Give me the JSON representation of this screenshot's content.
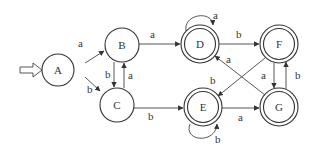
{
  "diagram": {
    "type": "finite-state-automaton",
    "start_state": "A",
    "states": [
      {
        "id": "A",
        "label": "A",
        "accepting": false,
        "x": 70,
        "y": 70
      },
      {
        "id": "B",
        "label": "B",
        "accepting": false,
        "x": 122,
        "y": 45
      },
      {
        "id": "C",
        "label": "C",
        "accepting": false,
        "x": 117,
        "y": 104
      },
      {
        "id": "D",
        "label": "D",
        "accepting": true,
        "x": 200,
        "y": 44
      },
      {
        "id": "E",
        "label": "E",
        "accepting": true,
        "x": 203,
        "y": 107
      },
      {
        "id": "F",
        "label": "F",
        "accepting": true,
        "x": 279,
        "y": 44
      },
      {
        "id": "G",
        "label": "G",
        "accepting": true,
        "x": 279,
        "y": 107
      }
    ],
    "transitions": [
      {
        "from": "A",
        "to": "B",
        "label": "a"
      },
      {
        "from": "A",
        "to": "C",
        "label": "b"
      },
      {
        "from": "B",
        "to": "C",
        "label": "b"
      },
      {
        "from": "C",
        "to": "B",
        "label": "a"
      },
      {
        "from": "B",
        "to": "D",
        "label": "a"
      },
      {
        "from": "C",
        "to": "E",
        "label": "b"
      },
      {
        "from": "D",
        "to": "D",
        "label": "a"
      },
      {
        "from": "D",
        "to": "F",
        "label": "b"
      },
      {
        "from": "E",
        "to": "E",
        "label": "b"
      },
      {
        "from": "E",
        "to": "G",
        "label": "a"
      },
      {
        "from": "F",
        "to": "E",
        "label": "b"
      },
      {
        "from": "F",
        "to": "G",
        "label": "a"
      },
      {
        "from": "G",
        "to": "F",
        "label": "b"
      },
      {
        "from": "G",
        "to": "D",
        "label": "a"
      }
    ]
  }
}
